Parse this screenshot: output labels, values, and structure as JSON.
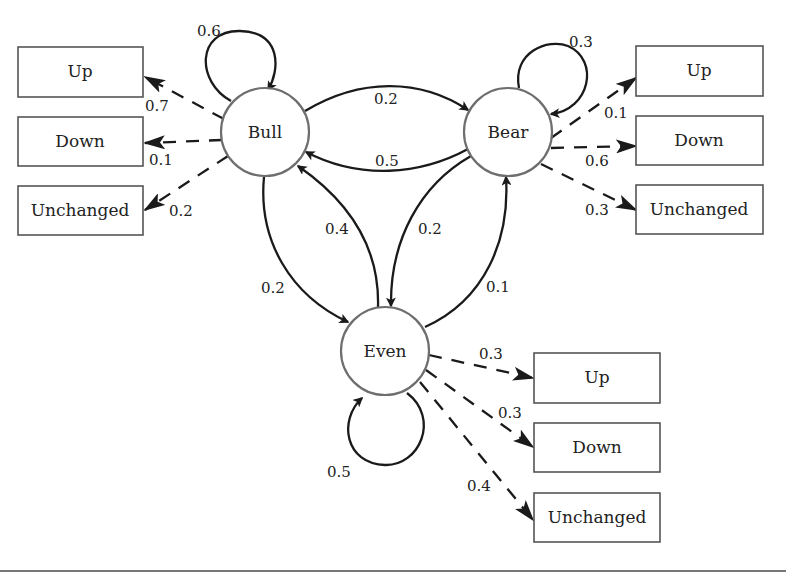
{
  "diagram": {
    "type": "hidden-markov-model",
    "states": [
      {
        "id": "bull",
        "label": "Bull"
      },
      {
        "id": "bear",
        "label": "Bear"
      },
      {
        "id": "even",
        "label": "Even"
      }
    ],
    "transitions": {
      "bull_bull": "0.6",
      "bull_bear": "0.2",
      "bull_even": "0.2",
      "bear_bear": "0.3",
      "bear_bull": "0.5",
      "bear_even": "0.2",
      "even_even": "0.5",
      "even_bull": "0.4",
      "even_bear": "0.1"
    },
    "emissions": {
      "bull": {
        "up": {
          "label": "Up",
          "prob": "0.7"
        },
        "down": {
          "label": "Down",
          "prob": "0.1"
        },
        "unchanged": {
          "label": "Unchanged",
          "prob": "0.2"
        }
      },
      "bear": {
        "up": {
          "label": "Up",
          "prob": "0.1"
        },
        "down": {
          "label": "Down",
          "prob": "0.6"
        },
        "unchanged": {
          "label": "Unchanged",
          "prob": "0.3"
        }
      },
      "even": {
        "up": {
          "label": "Up",
          "prob": "0.3"
        },
        "down": {
          "label": "Down",
          "prob": "0.3"
        },
        "unchanged": {
          "label": "Unchanged",
          "prob": "0.4"
        }
      }
    }
  },
  "colors": {
    "line": "#1a1a1a",
    "circle_stroke": "#6e6e6e",
    "box_stroke": "#555555",
    "background": "#ffffff"
  }
}
